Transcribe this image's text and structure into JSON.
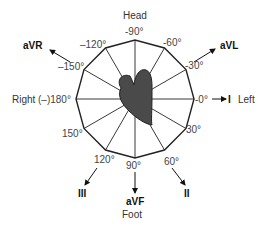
{
  "diagram": {
    "directions": {
      "top": "Head",
      "bottom": "Foot",
      "left": "Right",
      "right": "Left"
    },
    "angles": [
      {
        "id": "m90",
        "label": "-90°"
      },
      {
        "id": "m60",
        "label": "-60°"
      },
      {
        "id": "m30",
        "label": "-30°"
      },
      {
        "id": "0",
        "label": "-0°"
      },
      {
        "id": "30",
        "label": "30°"
      },
      {
        "id": "60",
        "label": "60°"
      },
      {
        "id": "90",
        "label": "90°"
      },
      {
        "id": "120",
        "label": "120°"
      },
      {
        "id": "150",
        "label": "150°"
      },
      {
        "id": "180",
        "label": "(–)180°"
      },
      {
        "id": "m150",
        "label": "–150°"
      },
      {
        "id": "m120",
        "label": "–120°"
      }
    ],
    "leads": {
      "aVR": "aVR",
      "aVL": "aVL",
      "I": "I",
      "II": "II",
      "III": "III",
      "aVF": "aVF"
    },
    "colors": {
      "heart_fill": "#4a4a4a",
      "lines": "#222222",
      "text": "#333333"
    }
  }
}
